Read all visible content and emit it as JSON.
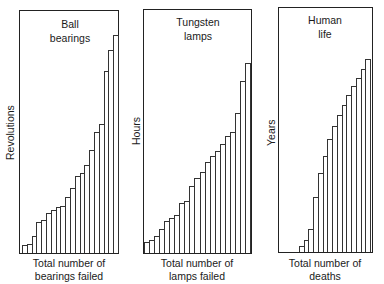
{
  "chart_data": [
    {
      "type": "bar",
      "title": "Ball bearings",
      "title_lines": [
        "Ball",
        "bearings"
      ],
      "xlabel": "Total number of bearings failed",
      "xlabel_lines": [
        "Total number of",
        "bearings failed"
      ],
      "ylabel": "Revolutions",
      "grid": false,
      "legend": null,
      "bar_count": 20,
      "values": [
        8,
        9,
        17,
        31,
        33,
        40,
        43,
        46,
        47,
        56,
        65,
        77,
        80,
        88,
        103,
        121,
        129,
        182,
        203,
        218
      ],
      "ylim": [
        0,
        243
      ],
      "note": "cumulative failure step chart; values are relative heights, no tick labels shown"
    },
    {
      "type": "bar",
      "title": "Tungsten lamps",
      "title_lines": [
        "Tungsten",
        "lamps"
      ],
      "xlabel": "Total number of lamps failed",
      "xlabel_lines": [
        "Total number of",
        "lamps failed"
      ],
      "ylabel": "Hours",
      "grid": false,
      "legend": null,
      "bar_count": 21,
      "values": [
        11,
        13,
        17,
        24,
        32,
        35,
        38,
        50,
        52,
        67,
        75,
        81,
        91,
        97,
        102,
        109,
        117,
        121,
        140,
        172,
        190
      ],
      "ylim": [
        0,
        244
      ],
      "note": "cumulative failure step chart; values are relative heights, no tick labels shown"
    },
    {
      "type": "bar",
      "title": "Human life",
      "title_lines": [
        "Human",
        "life"
      ],
      "xlabel": "Total number of deaths",
      "xlabel_lines": [
        "Total number of",
        "deaths"
      ],
      "ylabel": "Years",
      "grid": false,
      "legend": null,
      "bar_count": 15,
      "leading_empty_fraction": 0.22,
      "values": [
        6,
        12,
        23,
        55,
        79,
        96,
        113,
        126,
        137,
        147,
        157,
        166,
        174,
        183,
        193
      ],
      "ylim": [
        0,
        245
      ],
      "note": "cumulative failure step chart; values are relative heights, no tick labels shown"
    }
  ]
}
